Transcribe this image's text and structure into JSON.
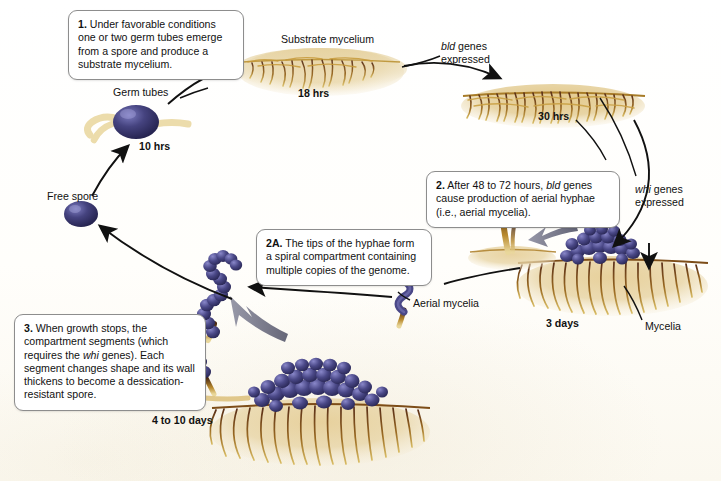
{
  "figure": {
    "background_color": "#fdfcf8",
    "spore_color": "#3b3a78",
    "mycelium_color": "#c19a3e",
    "aerial_color": "#e8d8a8",
    "arrow_color": "#111111"
  },
  "callouts": [
    {
      "id": "1",
      "number": "1.",
      "text": " Under favorable conditions one or two germ tubes emerge from a spore and produce a substrate mycelium."
    },
    {
      "id": "2",
      "number": "2.",
      "text_before": " After 48 to 72 hours, ",
      "italic": "bld",
      "text_after": " genes cause production of aerial hyphae (i.e., aerial mycelia)."
    },
    {
      "id": "2A",
      "number": "2A.",
      "text": " The tips of the hyphae form a spiral compartment containing multiple copies of the genome."
    },
    {
      "id": "3",
      "number": "3.",
      "text_before": " When growth stops, the compartment segments (which requires the ",
      "italic": "whi",
      "text_after": " genes). Each segment changes shape and its wall thickens to become a dessication-resistant spore."
    }
  ],
  "labels": {
    "substrate_mycelium": "Substrate mycelium",
    "hrs_18": "18 hrs",
    "bld_genes_line1": "bld",
    "bld_genes_line1_rest": " genes",
    "bld_genes_line2": "expressed",
    "hrs_30": "30 hrs",
    "whi_genes_line1": "whi",
    "whi_genes_line1_rest": " genes",
    "whi_genes_line2": "expressed",
    "germ_tubes": "Germ tubes",
    "hrs_10": "10 hrs",
    "free_spore": "Free spore",
    "aerial_mycelia": "Aerial mycelia",
    "days_3": "3 days",
    "mycelia": "Mycelia",
    "days_4_to_10": "4 to 10 days"
  }
}
